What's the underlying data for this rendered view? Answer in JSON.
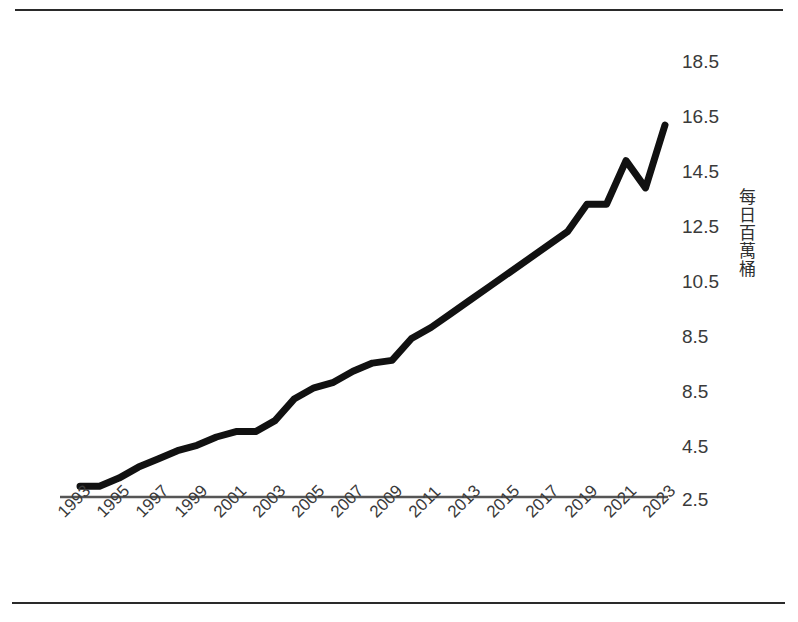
{
  "chart_title": "",
  "y_axis": {
    "title": "每日百萬桶",
    "tick_labels": [
      "18.5",
      "16.5",
      "14.5",
      "12.5",
      "10.5",
      "8.5",
      "8.5",
      "4.5",
      "2.5"
    ],
    "tick_positions_px": [
      62,
      117,
      172,
      227,
      282,
      337,
      392,
      447,
      500
    ]
  },
  "x_axis": {
    "tick_labels": [
      "1993",
      "1995",
      "1997",
      "1999",
      "2001",
      "2003",
      "2005",
      "2007",
      "2009",
      "2011",
      "2013",
      "2015",
      "2017",
      "2019",
      "2021",
      "2023"
    ],
    "tick_positions_px": [
      80,
      119,
      158,
      197,
      236,
      275,
      314,
      353,
      392,
      431,
      470,
      509,
      548,
      587,
      626,
      665
    ]
  },
  "colors": {
    "line": "#111111",
    "axis": "#555555",
    "rule": "#2a2a2a",
    "text": "#3a3a3a",
    "background": "#ffffff"
  },
  "chart_data": {
    "type": "line",
    "title": "",
    "xlabel": "",
    "ylabel": "每日百萬桶",
    "ylim": [
      2.5,
      18.5
    ],
    "xlim": [
      1993,
      2023
    ],
    "grid": false,
    "legend": "none",
    "x": [
      1993,
      1994,
      1995,
      1996,
      1997,
      1998,
      1999,
      2000,
      2001,
      2002,
      2003,
      2004,
      2005,
      2006,
      2007,
      2008,
      2009,
      2010,
      2011,
      2012,
      2013,
      2014,
      2015,
      2016,
      2017,
      2018,
      2019,
      2020,
      2021,
      2022,
      2023
    ],
    "series": [
      {
        "name": "每日百萬桶",
        "values": [
          3.0,
          3.0,
          3.3,
          3.7,
          4.0,
          4.3,
          4.5,
          4.8,
          5.0,
          5.0,
          5.4,
          6.2,
          6.6,
          6.8,
          7.2,
          7.5,
          7.6,
          8.4,
          8.8,
          9.3,
          9.8,
          10.3,
          10.8,
          11.3,
          11.8,
          12.3,
          13.3,
          13.3,
          14.9,
          13.9,
          16.2
        ]
      }
    ],
    "annotations": []
  }
}
